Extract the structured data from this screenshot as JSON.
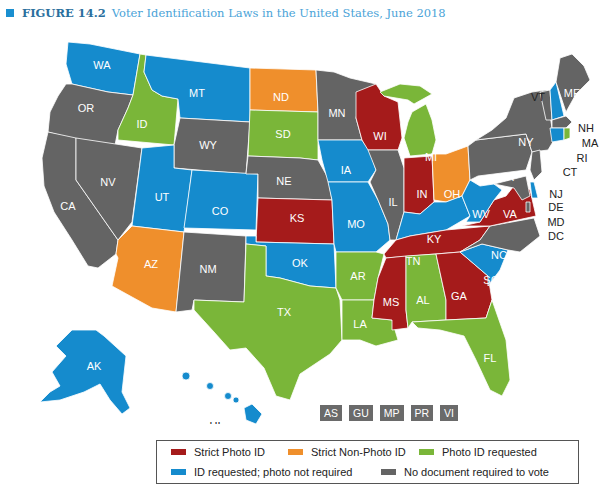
{
  "title": {
    "figure_label": "FIGURE 14.2",
    "text": "Voter Identification Laws in the United States, June 2018"
  },
  "colors": {
    "strict_photo": "#a51b1b",
    "strict_non_photo": "#ef8f2c",
    "photo_requested": "#7ab639",
    "id_requested": "#158bcd",
    "no_document": "#646464"
  },
  "legend": {
    "items": [
      {
        "key": "strict_photo",
        "label": "Strict Photo ID",
        "color": "#a51b1b"
      },
      {
        "key": "strict_non_photo",
        "label": "Strict Non-Photo ID",
        "color": "#ef8f2c"
      },
      {
        "key": "photo_requested",
        "label": "Photo ID requested",
        "color": "#7ab639"
      },
      {
        "key": "id_requested",
        "label": "ID requested; photo not required",
        "color": "#158bcd"
      },
      {
        "key": "no_document",
        "label": "No document required to vote",
        "color": "#646464"
      }
    ]
  },
  "territories": [
    "AS",
    "GU",
    "MP",
    "PR",
    "VI"
  ],
  "states": {
    "WA": "id_requested",
    "OR": "no_document",
    "CA": "no_document",
    "NV": "no_document",
    "ID": "photo_requested",
    "MT": "id_requested",
    "WY": "no_document",
    "UT": "id_requested",
    "AZ": "strict_non_photo",
    "CO": "id_requested",
    "NM": "no_document",
    "ND": "strict_non_photo",
    "SD": "photo_requested",
    "NE": "no_document",
    "KS": "strict_photo",
    "OK": "id_requested",
    "TX": "photo_requested",
    "MN": "no_document",
    "IA": "id_requested",
    "MO": "id_requested",
    "AR": "photo_requested",
    "LA": "photo_requested",
    "WI": "strict_photo",
    "IL": "no_document",
    "MI": "photo_requested",
    "IN": "strict_photo",
    "OH": "strict_non_photo",
    "KY": "id_requested",
    "TN": "strict_photo",
    "MS": "strict_photo",
    "AL": "photo_requested",
    "GA": "strict_photo",
    "FL": "photo_requested",
    "SC": "id_requested",
    "NC": "no_document",
    "VA": "strict_photo",
    "WV": "id_requested",
    "PA": "no_document",
    "NY": "no_document",
    "VT": "no_document",
    "NH": "id_requested",
    "ME": "no_document",
    "MA": "no_document",
    "RI": "photo_requested",
    "CT": "id_requested",
    "NJ": "no_document",
    "DE": "id_requested",
    "MD": "no_document",
    "DC": "no_document",
    "AK": "id_requested",
    "HI": "id_requested"
  },
  "labels": {
    "WA": "WA",
    "OR": "OR",
    "CA": "CA",
    "NV": "NV",
    "ID": "ID",
    "MT": "MT",
    "WY": "WY",
    "UT": "UT",
    "AZ": "AZ",
    "CO": "CO",
    "NM": "NM",
    "ND": "ND",
    "SD": "SD",
    "NE": "NE",
    "KS": "KS",
    "OK": "OK",
    "TX": "TX",
    "MN": "MN",
    "IA": "IA",
    "MO": "MO",
    "AR": "AR",
    "LA": "LA",
    "WI": "WI",
    "IL": "IL",
    "MI": "MI",
    "IN": "IN",
    "OH": "OH",
    "KY": "KY",
    "TN": "TN",
    "MS": "MS",
    "AL": "AL",
    "GA": "GA",
    "FL": "FL",
    "SC": "SC",
    "NC": "NC",
    "VA": "VA",
    "WV": "WV",
    "PA": "PA",
    "NY": "NY",
    "VT": "VT",
    "NH": "NH",
    "ME": "ME",
    "MA": "MA",
    "RI": "RI",
    "CT": "CT",
    "NJ": "NJ",
    "DE": "DE",
    "MD": "MD",
    "DC": "DC",
    "AK": "AK",
    "HI": "HI"
  }
}
